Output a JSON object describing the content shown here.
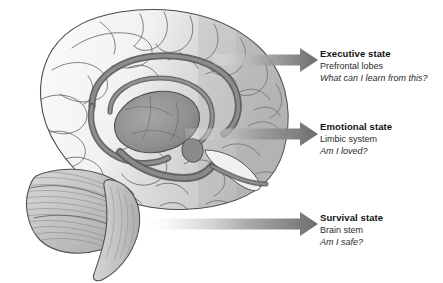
{
  "figure": {
    "background_color": "#ffffff",
    "width": 443,
    "height": 283
  },
  "illustration": {
    "name": "mid-sagittal-brain-illustration",
    "description": "Grayscale medial sagittal section of a human brain showing cerebral cortex, corpus callosum, thalamus, limbic structures, cerebellum and brain stem",
    "parts": [
      "cerebral-cortex",
      "corpus-callosum",
      "fornix",
      "thalamus",
      "hippocampus",
      "cerebellum",
      "brain-stem"
    ],
    "colors": {
      "cortex_light": "#f4f4f4",
      "cortex_shade": "#c9c9c9",
      "outline": "#4a4a4a",
      "limbic_band": "#7d7d7d",
      "limbic_dark": "#6e6e6e",
      "thalamus": "#8f8f8f",
      "cerebellum": "#bdbdbd",
      "brainstem": "#c4c4c4"
    }
  },
  "arrows": {
    "color_head": "#6e6e6e",
    "color_tail": "#f2f2f2",
    "items": [
      {
        "name": "arrow-executive",
        "origin_x": 213,
        "tip_x": 318,
        "center_y": 60
      },
      {
        "name": "arrow-emotional",
        "origin_x": 185,
        "tip_x": 318,
        "center_y": 134
      },
      {
        "name": "arrow-survival",
        "origin_x": 148,
        "tip_x": 318,
        "center_y": 224
      }
    ]
  },
  "callouts": [
    {
      "id": "executive",
      "title": "Executive state",
      "subtitle": "Prefrontal lobes",
      "question": "What can I learn from this?"
    },
    {
      "id": "emotional",
      "title": "Emotional state",
      "subtitle": "Limbic system",
      "question": "Am I loved?"
    },
    {
      "id": "survival",
      "title": "Survival state",
      "subtitle": "Brain stem",
      "question": "Am I safe?"
    }
  ]
}
